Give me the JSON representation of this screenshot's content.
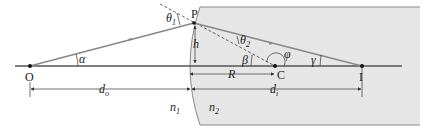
{
  "diagram": {
    "type": "refraction at spherical surface",
    "points": {
      "object": "O",
      "incidence_point": "P",
      "center_of_curvature": "C",
      "image": "I"
    },
    "angles": {
      "incidence": "θ",
      "incidence_sub": "1",
      "refraction": "θ",
      "refraction_sub": "2",
      "alpha": "α",
      "beta": "β",
      "gamma": "γ",
      "phi": "φ"
    },
    "lengths": {
      "height": "h",
      "radius": "R",
      "object_distance": "d",
      "object_distance_sub": "o",
      "image_distance": "d",
      "image_distance_sub": "i"
    },
    "media": {
      "n1": "n",
      "n1_sub": "1",
      "n2": "n",
      "n2_sub": "2"
    },
    "colors": {
      "medium2_fill": "#e6e6e6",
      "ray": "#888888",
      "axis": "#555555",
      "text": "#222222"
    }
  }
}
